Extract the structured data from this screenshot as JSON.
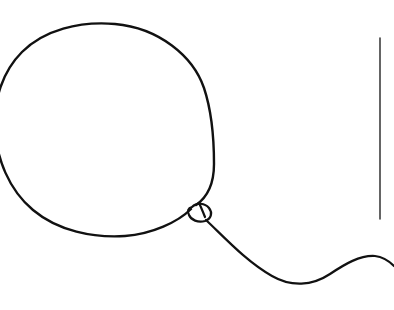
{
  "canvas": {
    "width": 394,
    "height": 310,
    "background_color": "#ffffff",
    "stroke_color": "#111111",
    "title": "Balloon line drawing"
  },
  "drawing": {
    "style": "hand-drawn single-line sketch",
    "subject": "balloon with knot and wavy string",
    "elements": [
      {
        "name": "balloon-body",
        "description": "large rounded balloon outline, cropped at left edge of canvas",
        "stroke_width": 2.4,
        "bounds": {
          "x": 0,
          "y": 23,
          "width": 216,
          "height": 213
        },
        "path": "M 196 205 C 209 196 214 180 214 164 C 214 139 212 112 204 88 C 193 56 159 28 115 24 C 79 21 44 30 22 52 C 2 72 -6 100 -5 127 C -4 158 9 190 33 210 C 58 231 93 238 125 236 C 152 234 178 222 191 209"
      },
      {
        "name": "balloon-knot",
        "description": "small twisted loop at base of balloon where neck is tied",
        "stroke_width": 2.2,
        "bounds": {
          "x": 188,
          "y": 202,
          "width": 26,
          "height": 22
        },
        "path": "M 192 207 C 197 202 205 203 209 208 C 213 213 211 219 205 221 C 198 223 191 220 189 215 C 187 211 188 208 192 207 Z"
      },
      {
        "name": "balloon-neck",
        "description": "short connector between balloon body and knot",
        "stroke_width": 2.2,
        "path": "M 199 203 C 201 207 203 212 205 217"
      },
      {
        "name": "balloon-string",
        "description": "wavy string descending from knot, dipping then rising toward right edge",
        "stroke_width": 2.2,
        "bounds": {
          "x": 205,
          "y": 218,
          "width": 189,
          "height": 66
        },
        "path": "M 206 220 C 225 238 247 262 272 276 C 291 287 312 286 330 274 C 345 264 360 255 375 256 C 383 257 389 261 394 266"
      },
      {
        "name": "vertical-caret-line",
        "description": "thin vertical line near right edge, resembling a text cursor or divider",
        "stroke_width": 1.3,
        "x": 380,
        "y_start": 38,
        "y_end": 219,
        "path": "M 380 38 L 380 219"
      }
    ]
  }
}
